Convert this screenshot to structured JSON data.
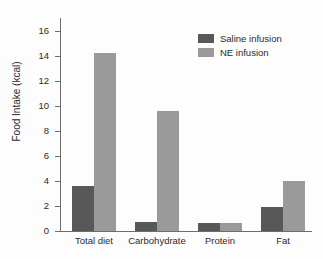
{
  "chart_data": {
    "type": "bar",
    "title": "",
    "xlabel": "",
    "ylabel": "Food Intake (kcal)",
    "ylim": [
      0,
      17
    ],
    "yticks": [
      0,
      2,
      4,
      6,
      8,
      10,
      12,
      14,
      16
    ],
    "grid": false,
    "legend_position": "top-right",
    "categories": [
      "Total diet",
      "Carbohydrate",
      "Protein",
      "Fat"
    ],
    "series": [
      {
        "name": "Saline infusion",
        "color": "#585858",
        "values": [
          3.6,
          0.7,
          0.65,
          1.9
        ]
      },
      {
        "name": "NE infusion",
        "color": "#9a9a9a",
        "values": [
          14.2,
          9.6,
          0.65,
          4.0
        ]
      }
    ]
  },
  "axis": {
    "y_title": "Food Intake (kcal)",
    "tick_labels": [
      "0",
      "2",
      "4",
      "6",
      "8",
      "10",
      "12",
      "14",
      "16"
    ]
  },
  "legend": {
    "items": [
      {
        "label": "Saline infusion",
        "color": "#585858"
      },
      {
        "label": "NE infusion",
        "color": "#9a9a9a"
      }
    ]
  }
}
